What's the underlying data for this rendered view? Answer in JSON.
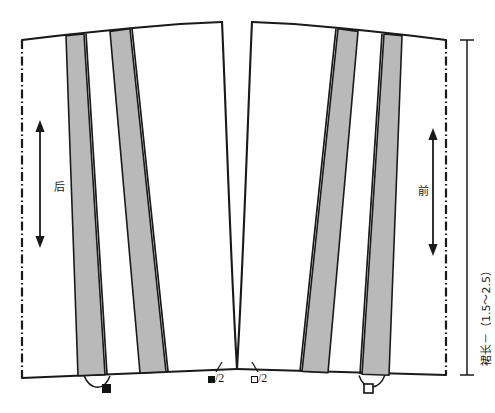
{
  "diagram": {
    "colors": {
      "line": "#1a1a1a",
      "gore_fill": "#b9b9b9",
      "gore_stroke": "#1a1a1a",
      "background": "#ffffff"
    },
    "panels": [
      {
        "id": "back",
        "label": "后",
        "fold_edge": "left",
        "grainline": "double-arrow-vertical",
        "notch_marker": "filled-square",
        "gore_count": 2
      },
      {
        "id": "front",
        "label": "前",
        "fold_edge": "right",
        "grainline": "double-arrow-vertical",
        "notch_marker": "open-square",
        "gore_count": 2
      }
    ],
    "center_labels": [
      {
        "id": "back-hem-measure",
        "marker": "filled-square",
        "text": "/2"
      },
      {
        "id": "front-hem-measure",
        "marker": "open-square",
        "text": "/2"
      }
    ],
    "dimension": {
      "id": "skirt-length",
      "text": "裙长－（1.5～2.5）",
      "orientation": "vertical",
      "side": "right"
    }
  }
}
